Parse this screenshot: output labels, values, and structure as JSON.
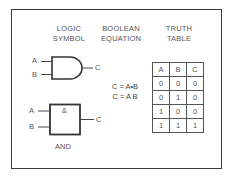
{
  "headings": {
    "logic_symbol": [
      "LOGIC",
      "SYMBOL"
    ],
    "boolean_equation": [
      "BOOLEAN",
      "EQUATION"
    ],
    "truth_table": [
      "TRUTH",
      "TABLE"
    ]
  },
  "gate_ansi": {
    "input_a": "A",
    "input_b": "B",
    "output": "C"
  },
  "gate_iec": {
    "input_a": "A",
    "input_b": "B",
    "output": "C",
    "symbol": "&",
    "caption": "AND"
  },
  "equations": [
    "C = A•B",
    "C = A B"
  ],
  "truth_table": {
    "headers": [
      "A",
      "B",
      "C"
    ],
    "rows": [
      [
        "0",
        "0",
        "0"
      ],
      [
        "0",
        "1",
        "0"
      ],
      [
        "1",
        "0",
        "0"
      ],
      [
        "1",
        "1",
        "1"
      ]
    ]
  }
}
